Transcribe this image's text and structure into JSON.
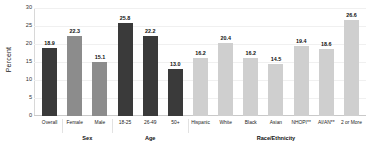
{
  "chart_data": {
    "type": "bar",
    "title": "",
    "xlabel": "",
    "ylabel": "Percent",
    "ylim": [
      0,
      30
    ],
    "ytick_labels": [
      "30",
      "25",
      "20",
      "15",
      "10",
      "5",
      "0"
    ],
    "ytick_values": [
      30,
      25,
      20,
      15,
      10,
      5,
      0
    ],
    "grid": true,
    "legend": "none",
    "categories": [
      "Overall",
      "Female",
      "Male",
      "18-25",
      "26-49",
      "50+",
      "Hispanic",
      "White",
      "Black",
      "Asian",
      "NHOPI**",
      "AI/AN**",
      "2 or More"
    ],
    "values": [
      18.9,
      22.3,
      15.1,
      25.8,
      22.2,
      13.0,
      16.2,
      20.4,
      16.2,
      14.5,
      19.4,
      18.6,
      26.6
    ],
    "value_labels": [
      "18.9",
      "22.3",
      "15.1",
      "25.8",
      "22.2",
      "13.0",
      "16.2",
      "20.4",
      "16.2",
      "14.5",
      "19.4",
      "18.6",
      "26.6"
    ],
    "bar_shades": [
      "dark",
      "mid",
      "mid",
      "dark",
      "dark",
      "dark",
      "light",
      "light",
      "light",
      "light",
      "light",
      "light",
      "light"
    ],
    "groups": [
      {
        "label": "",
        "span": 1
      },
      {
        "label": "Sex",
        "span": 2
      },
      {
        "label": "Age",
        "span": 3
      },
      {
        "label": "Race/Ethnicity",
        "span": 7
      }
    ],
    "colors": {
      "dark": "#3a3a3a",
      "mid": "#8c8c8c",
      "light": "#cfcfcf",
      "grid": "#f0f0f0",
      "axis": "#c9c9c9",
      "text": "#1a1a1a"
    }
  }
}
